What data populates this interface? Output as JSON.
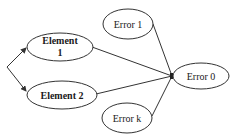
{
  "diagram": {
    "nodes": {
      "element1": {
        "line1": "Element",
        "line2": "1"
      },
      "element2": {
        "label": "Element 2"
      },
      "error1": {
        "label": "Error 1"
      },
      "error0": {
        "label": "Error 0"
      },
      "errork": {
        "label": "Error k"
      }
    },
    "edges": [
      {
        "from": "branch",
        "to": "element1",
        "arrow": true
      },
      {
        "from": "branch",
        "to": "element2",
        "arrow": true
      },
      {
        "from": "element1",
        "to": "junction"
      },
      {
        "from": "element2",
        "to": "junction"
      },
      {
        "from": "error1",
        "to": "junction"
      },
      {
        "from": "errork",
        "to": "junction"
      },
      {
        "from": "junction",
        "to": "error0",
        "arrow": true
      }
    ],
    "colors": {
      "stroke": "#333333",
      "fill": "#ffffff",
      "text": "#1a1a1a"
    }
  }
}
